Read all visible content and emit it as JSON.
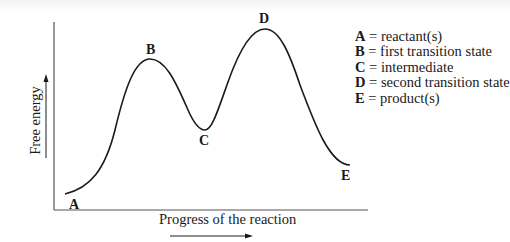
{
  "diagram": {
    "y_axis_label": "Free energy",
    "x_axis_label": "Progress of the reaction",
    "points": [
      {
        "key": "A",
        "description": "reactant(s)"
      },
      {
        "key": "B",
        "description": "first transition state"
      },
      {
        "key": "C",
        "description": "intermediate"
      },
      {
        "key": "D",
        "description": "second transition state"
      },
      {
        "key": "E",
        "description": "product(s)"
      }
    ],
    "legend": [
      {
        "key": "A",
        "sep": " = ",
        "text": "reactant(s)"
      },
      {
        "key": "B",
        "sep": " = ",
        "text": "first transition state"
      },
      {
        "key": "C",
        "sep": " = ",
        "text": "intermediate"
      },
      {
        "key": "D",
        "sep": " = ",
        "text": "second transition state"
      },
      {
        "key": "E",
        "sep": " = ",
        "text": "product(s)"
      }
    ],
    "colors": {
      "curve": "#1a1a1a",
      "axes": "#555555",
      "background": "#ffffff"
    }
  }
}
